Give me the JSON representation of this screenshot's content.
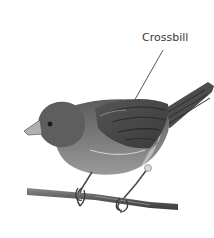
{
  "figure": {
    "label": "Crossbill",
    "colors": {
      "background": "#ffffff",
      "label_text": "#3a3a3a",
      "leader_line": "#444444",
      "body_dark": "#4a4a4a",
      "body_mid": "#7a7a7a",
      "body_light": "#b5b5b5",
      "branch": "#5a5a5a"
    }
  }
}
